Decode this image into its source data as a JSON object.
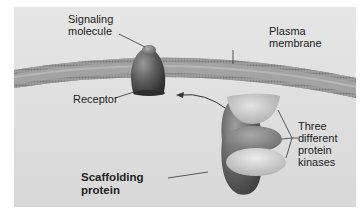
{
  "diagram": {
    "colors": {
      "panel": "#dedede",
      "membrane": "#9a9a9a",
      "receptor": "#555555",
      "scaffold": "#666666",
      "kinase_top": "#c4c4c4",
      "kinase_middle": "#8c8c8c",
      "kinase_bottom": "#c8c8c8",
      "leader_line": "#333333"
    },
    "labels": {
      "signaling_molecule": [
        "Signaling",
        "molecule"
      ],
      "plasma_membrane": [
        "Plasma",
        "membrane"
      ],
      "receptor": [
        "Receptor"
      ],
      "scaffolding_protein": [
        "Scaffolding",
        "protein"
      ],
      "protein_kinases": [
        "Three",
        "different",
        "protein",
        "kinases"
      ]
    },
    "elements": [
      {
        "id": "plasma-membrane",
        "type": "lipid-bilayer"
      },
      {
        "id": "receptor",
        "type": "membrane-protein"
      },
      {
        "id": "signaling-molecule",
        "type": "ligand",
        "bound_to": "receptor"
      },
      {
        "id": "scaffolding-protein",
        "type": "protein"
      },
      {
        "id": "kinase-1",
        "type": "protein-kinase",
        "bound_to": "scaffolding-protein"
      },
      {
        "id": "kinase-2",
        "type": "protein-kinase",
        "bound_to": "scaffolding-protein"
      },
      {
        "id": "kinase-3",
        "type": "protein-kinase",
        "bound_to": "scaffolding-protein"
      }
    ],
    "arrows": [
      {
        "from": "scaffolding-protein",
        "to": "receptor"
      }
    ]
  }
}
